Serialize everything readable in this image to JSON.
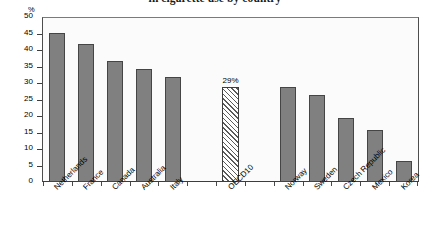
{
  "chart_data": {
    "type": "bar",
    "title": "in cigarette use by country",
    "xlabel": "",
    "ylabel": "%",
    "ylim": [
      0,
      50
    ],
    "ytick_step": 5,
    "yticks": [
      "50",
      "45",
      "40",
      "35",
      "30",
      "25",
      "20",
      "15",
      "10",
      "5",
      "0"
    ],
    "grid": false,
    "legend": "none",
    "categories": [
      "Netherlands",
      "France",
      "Canada",
      "Australia",
      "Italy",
      "OECD10",
      "Norway",
      "Sweden",
      "Czech Republic",
      "Mexico",
      "Korea"
    ],
    "values": [
      45.5,
      42,
      37,
      34.5,
      32,
      29,
      29,
      26.5,
      19.5,
      16,
      6.5
    ],
    "data_labels": [
      "",
      "",
      "",
      "",
      "",
      "29%",
      "",
      "",
      "",
      "",
      ""
    ],
    "highlight_category": "OECD10",
    "highlight_style": "hatched",
    "bar_color": "#808080",
    "bar_border_color": "#454545",
    "plot_background": "#fbfbfb"
  },
  "axis": {
    "unit_label": "%"
  }
}
